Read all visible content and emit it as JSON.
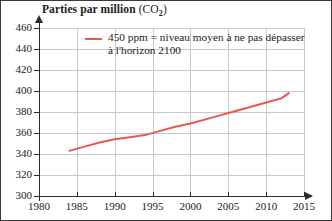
{
  "chart_data": {
    "type": "line",
    "title": "Parties par million (CO2)",
    "title_main": "Parties par million",
    "title_paren_open": "(CO",
    "title_sub": "2",
    "title_paren_close": ")",
    "xlabel": "",
    "ylabel": "",
    "xlim": [
      1980,
      2015
    ],
    "ylim": [
      300,
      460
    ],
    "xticks": [
      1980,
      1985,
      1990,
      1995,
      2000,
      2005,
      2010,
      2015
    ],
    "yticks": [
      300,
      320,
      340,
      360,
      380,
      400,
      420,
      440,
      460
    ],
    "grid": true,
    "legend_position": "top-center",
    "series": [
      {
        "name": "CO2 mesure (ppm)",
        "color": "#e8584f",
        "x": [
          1984,
          1986,
          1988,
          1990,
          1992,
          1994,
          1996,
          1998,
          2000,
          2002,
          2004,
          2006,
          2008,
          2010,
          2012,
          2013
        ],
        "values": [
          343,
          347,
          351,
          354,
          356,
          358,
          362,
          366,
          369,
          373,
          377,
          381,
          385,
          389,
          393,
          398
        ]
      }
    ],
    "annotations": [
      {
        "name": "legend-450ppm",
        "text": "450 ppm = niveau moyen à ne pas dépasser à l'horizon 2100",
        "color": "#e8584f"
      }
    ]
  },
  "legend": {
    "line1": "450 ppm = niveau moyen à ne pas",
    "line2": "dépasser à l'horizon 2100"
  },
  "colors": {
    "series": "#e8584f",
    "grid": "#c9c9c9",
    "axis": "#2b2b2b",
    "text": "#1b1b1b",
    "background": "#ffffff",
    "border": "#3a3a3a"
  }
}
